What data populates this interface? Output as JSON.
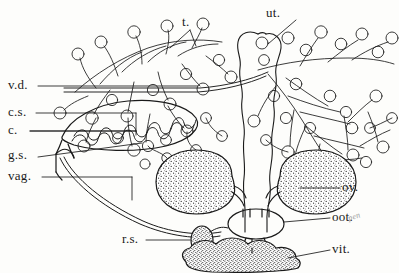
{
  "figure": {
    "ink_color": "#1a1a1a",
    "background_color": "#fdfdfb",
    "stipple_color": "#333333"
  },
  "labels": {
    "testes": "t.",
    "uterus": "ut.",
    "vas_deferens": "v.d.",
    "cirrus_sac": "c.s.",
    "cirrus": "c.",
    "genital_sinus": "g.s.",
    "vagina": "vag.",
    "ovary": "ov.",
    "ootype": "oot.",
    "vitellarium": "vit.",
    "receptaculum_seminis": "r.s.",
    "pencil_note": "pen"
  },
  "structures": {
    "ovary_left": "left ovary",
    "ovary_right": "right ovary",
    "vitellarium_mass": "vitelline gland mass",
    "receptaculum": "seminal receptacle",
    "ootype_chamber": "ootype chamber",
    "uterus_tube": "uterine tube",
    "cirrus_pouch": "cirrus pouch",
    "testis_field_left": "left testis field",
    "testis_field_right": "right testis field"
  }
}
